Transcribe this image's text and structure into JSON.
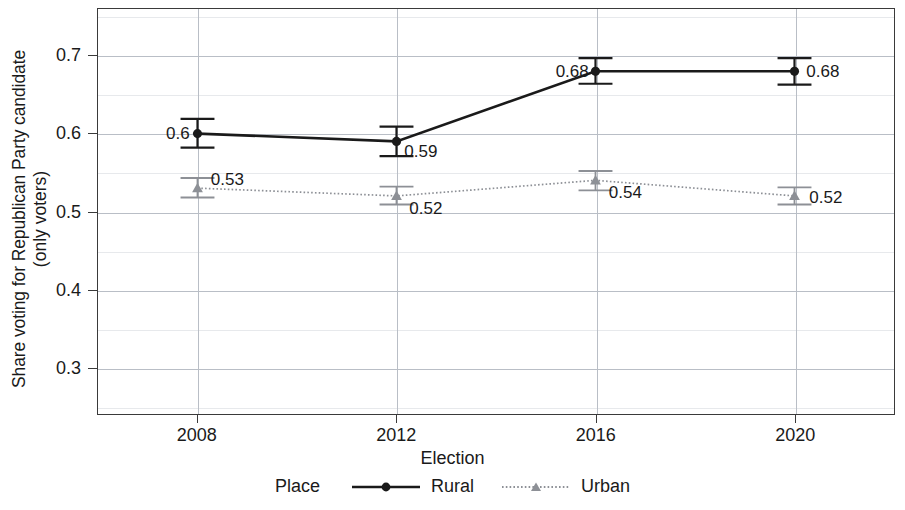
{
  "chart_data": {
    "type": "line",
    "title": "",
    "xlabel": "Election",
    "ylabel": "Share voting for Republican Party candidate (only voters)",
    "ylabel_line1": "Share voting for Republican Party candidate",
    "ylabel_line2": "(only voters)",
    "categories": [
      "2008",
      "2012",
      "2016",
      "2020"
    ],
    "x": [
      2008,
      2012,
      2016,
      2020
    ],
    "ylim": [
      0.24,
      0.76
    ],
    "y_ticks": [
      "0.3",
      "0.4",
      "0.5",
      "0.6",
      "0.7"
    ],
    "y_tick_values": [
      0.3,
      0.4,
      0.5,
      0.6,
      0.7
    ],
    "y_minor_ticks": [
      0.25,
      0.35,
      0.45,
      0.55,
      0.65,
      0.75
    ],
    "grid": true,
    "legend_position": "bottom",
    "legend_title": "Place",
    "series": [
      {
        "name": "Rural",
        "color": "#1a1a1a",
        "marker": "circle",
        "linestyle": "solid",
        "values": [
          0.6,
          0.59,
          0.68,
          0.68
        ],
        "labels": [
          "0.6",
          "0.59",
          "0.68",
          "0.68"
        ],
        "label_anchor": [
          "right",
          "left",
          "right",
          "left"
        ],
        "error_low": [
          0.582,
          0.571,
          0.664,
          0.663
        ],
        "error_high": [
          0.619,
          0.609,
          0.697,
          0.697
        ]
      },
      {
        "name": "Urban",
        "color": "#8d9096",
        "marker": "triangle",
        "linestyle": "dotted",
        "values": [
          0.53,
          0.52,
          0.54,
          0.52
        ],
        "labels": [
          "0.53",
          "0.52",
          "0.54",
          "0.52"
        ],
        "label_anchor": [
          "left",
          "left",
          "left",
          "left"
        ],
        "error_low": [
          0.518,
          0.509,
          0.527,
          0.509
        ],
        "error_high": [
          0.543,
          0.532,
          0.552,
          0.531
        ]
      }
    ]
  },
  "axes": {
    "x_title": "Election",
    "y_title_line1": "Share voting for Republican Party candidate",
    "y_title_line2": "(only voters)"
  },
  "legend": {
    "title": "Place",
    "entries": [
      {
        "label": "Rural",
        "marker": "circle-marker-icon"
      },
      {
        "label": "Urban",
        "marker": "triangle-marker-icon"
      }
    ]
  },
  "colors": {
    "rural": "#1a1a1a",
    "urban": "#8d9096",
    "frame": "#3a3a3a",
    "grid_major": "#b9bec6",
    "grid_minor": "#e7e9ec",
    "background": "#ffffff"
  }
}
